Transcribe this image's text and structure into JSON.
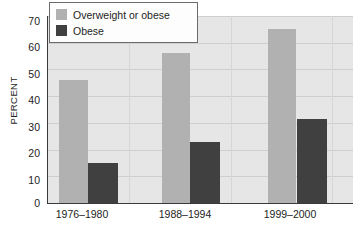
{
  "chart_data": {
    "type": "bar",
    "title": "",
    "subtitle": "",
    "xlabel": "",
    "ylabel": "PERCENT",
    "categories": [
      "1976–1980",
      "1988–1994",
      "1999–2000"
    ],
    "series": [
      {
        "name": "Overweight or obese",
        "values": [
          46,
          56,
          65
        ],
        "color": "#b1b1b1"
      },
      {
        "name": "Obese",
        "values": [
          15,
          23,
          31.5
        ],
        "color": "#404040"
      }
    ],
    "ylim": [
      0,
      70
    ],
    "yticks": [
      0,
      10,
      20,
      30,
      40,
      50,
      60,
      70
    ],
    "ytick_labels": [
      "0",
      "10",
      "20",
      "30",
      "40",
      "50",
      "60",
      "70"
    ],
    "grid": "horizontal-and-vertical",
    "grid_color": "#cfcfcf",
    "plot_background": "#e6e6e6",
    "legend_position": "top-left",
    "legend_entries": [
      "Overweight or obese",
      "Obese"
    ],
    "annotations": []
  },
  "axis": {
    "y_title": "PERCENT",
    "y_labels": [
      "70",
      "60",
      "50",
      "40",
      "30",
      "20",
      "10",
      "0"
    ],
    "x_labels": [
      "1976–1980",
      "1988–1994",
      "1999–2000"
    ]
  },
  "legend": {
    "items": [
      {
        "label": "Overweight or obese",
        "swatch": "light-gray-swatch"
      },
      {
        "label": "Obese",
        "swatch": "dark-gray-swatch"
      }
    ]
  }
}
